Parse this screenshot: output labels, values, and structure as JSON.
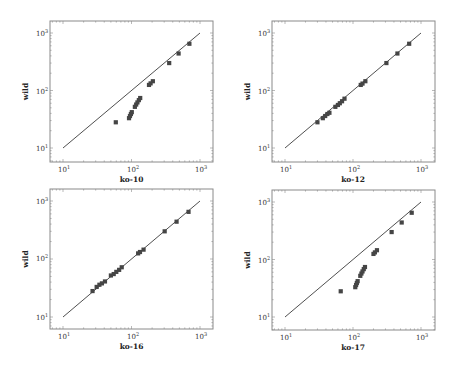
{
  "chart_data": [
    {
      "type": "scatter",
      "title": "",
      "xlabel": "ko-10",
      "ylabel": "wild",
      "xscale": "log",
      "yscale": "log",
      "xlim": [
        7,
        1400
      ],
      "ylim": [
        6.5,
        1400
      ],
      "xticks": [
        "10^1",
        "10^2",
        "10^3"
      ],
      "yticks": [
        "10^1",
        "10^2",
        "10^3"
      ],
      "reference_line": {
        "x": [
          10,
          1000
        ],
        "y": [
          10,
          1000
        ]
      },
      "grid": false,
      "points": [
        {
          "x": 59,
          "y": 28
        },
        {
          "x": 92,
          "y": 33
        },
        {
          "x": 95,
          "y": 36
        },
        {
          "x": 98,
          "y": 39
        },
        {
          "x": 101,
          "y": 42
        },
        {
          "x": 112,
          "y": 52
        },
        {
          "x": 117,
          "y": 57
        },
        {
          "x": 122,
          "y": 62
        },
        {
          "x": 128,
          "y": 68
        },
        {
          "x": 134,
          "y": 74
        },
        {
          "x": 180,
          "y": 125
        },
        {
          "x": 190,
          "y": 133
        },
        {
          "x": 205,
          "y": 145
        },
        {
          "x": 355,
          "y": 300
        },
        {
          "x": 487,
          "y": 440
        },
        {
          "x": 700,
          "y": 650
        }
      ]
    },
    {
      "type": "scatter",
      "title": "",
      "xlabel": "ko-12",
      "ylabel": "wild",
      "xscale": "log",
      "yscale": "log",
      "xlim": [
        7,
        1400
      ],
      "ylim": [
        6.5,
        1400
      ],
      "xticks": [
        "10^1",
        "10^2",
        "10^3"
      ],
      "yticks": [
        "10^1",
        "10^2",
        "10^3"
      ],
      "reference_line": {
        "x": [
          10,
          1000
        ],
        "y": [
          10,
          1000
        ]
      },
      "grid": false,
      "points": [
        {
          "x": 30,
          "y": 28
        },
        {
          "x": 36,
          "y": 33
        },
        {
          "x": 39,
          "y": 36
        },
        {
          "x": 42,
          "y": 39
        },
        {
          "x": 45,
          "y": 41
        },
        {
          "x": 55,
          "y": 52
        },
        {
          "x": 60,
          "y": 56
        },
        {
          "x": 64,
          "y": 60
        },
        {
          "x": 69,
          "y": 65
        },
        {
          "x": 75,
          "y": 72
        },
        {
          "x": 130,
          "y": 125
        },
        {
          "x": 138,
          "y": 132
        },
        {
          "x": 152,
          "y": 145
        },
        {
          "x": 310,
          "y": 300
        },
        {
          "x": 450,
          "y": 440
        },
        {
          "x": 670,
          "y": 650
        }
      ]
    },
    {
      "type": "scatter",
      "title": "",
      "xlabel": "ko-16",
      "ylabel": "wild",
      "xscale": "log",
      "yscale": "log",
      "xlim": [
        7,
        1400
      ],
      "ylim": [
        6.5,
        1400
      ],
      "xticks": [
        "10^1",
        "10^2",
        "10^3"
      ],
      "yticks": [
        "10^1",
        "10^2",
        "10^3"
      ],
      "reference_line": {
        "x": [
          10,
          1000
        ],
        "y": [
          10,
          1000
        ]
      },
      "grid": false,
      "points": [
        {
          "x": 27,
          "y": 28
        },
        {
          "x": 31,
          "y": 33
        },
        {
          "x": 34,
          "y": 36
        },
        {
          "x": 37,
          "y": 38
        },
        {
          "x": 41,
          "y": 41
        },
        {
          "x": 50,
          "y": 52
        },
        {
          "x": 55,
          "y": 55
        },
        {
          "x": 60,
          "y": 60
        },
        {
          "x": 66,
          "y": 65
        },
        {
          "x": 72,
          "y": 72
        },
        {
          "x": 125,
          "y": 125
        },
        {
          "x": 133,
          "y": 132
        },
        {
          "x": 150,
          "y": 145
        },
        {
          "x": 305,
          "y": 300
        },
        {
          "x": 455,
          "y": 440
        },
        {
          "x": 680,
          "y": 650
        }
      ]
    },
    {
      "type": "scatter",
      "title": "",
      "xlabel": "ko-17",
      "ylabel": "wild",
      "xscale": "log",
      "yscale": "log",
      "xlim": [
        7,
        1400
      ],
      "ylim": [
        6.5,
        1400
      ],
      "xticks": [
        "10^1",
        "10^2",
        "10^3"
      ],
      "yticks": [
        "10^1",
        "10^2",
        "10^3"
      ],
      "reference_line": {
        "x": [
          10,
          1000
        ],
        "y": [
          10,
          1000
        ]
      },
      "grid": false,
      "points": [
        {
          "x": 66,
          "y": 28
        },
        {
          "x": 108,
          "y": 33
        },
        {
          "x": 111,
          "y": 36
        },
        {
          "x": 114,
          "y": 39
        },
        {
          "x": 117,
          "y": 42
        },
        {
          "x": 128,
          "y": 52
        },
        {
          "x": 133,
          "y": 57
        },
        {
          "x": 138,
          "y": 62
        },
        {
          "x": 144,
          "y": 68
        },
        {
          "x": 150,
          "y": 74
        },
        {
          "x": 200,
          "y": 125
        },
        {
          "x": 210,
          "y": 133
        },
        {
          "x": 225,
          "y": 145
        },
        {
          "x": 370,
          "y": 300
        },
        {
          "x": 520,
          "y": 440
        },
        {
          "x": 730,
          "y": 650
        }
      ]
    }
  ],
  "layout": {
    "panels": [
      {
        "frame": [
          50,
          21,
          213,
          162
        ],
        "x_decades_px": [
          63,
          132,
          200
        ],
        "y_decades_px": [
          148,
          91,
          33
        ]
      },
      {
        "frame": [
          272,
          21,
          435,
          162
        ],
        "x_decades_px": [
          285,
          353,
          421
        ],
        "y_decades_px": [
          148,
          91,
          33
        ]
      },
      {
        "frame": [
          50,
          189,
          213,
          329
        ],
        "x_decades_px": [
          63,
          132,
          200
        ],
        "y_decades_px": [
          317,
          258,
          201
        ]
      },
      {
        "frame": [
          272,
          190,
          435,
          330
        ],
        "x_decades_px": [
          285,
          353,
          421
        ],
        "y_decades_px": [
          317,
          260,
          202
        ]
      }
    ]
  },
  "colors": {
    "frame": "#8a8a8a",
    "line": "#222222",
    "marker": "#454545",
    "tick_text": "#333333",
    "label_text": "#222222"
  }
}
